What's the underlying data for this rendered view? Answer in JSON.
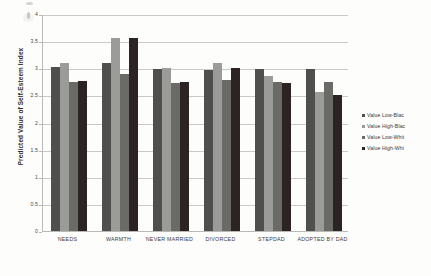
{
  "chart_data": {
    "type": "bar",
    "title": "",
    "xlabel": "",
    "ylabel": "Predicted Value of Self-Esteem Index",
    "ylim": [
      0,
      4
    ],
    "ytick_labels": [
      "4",
      "3.5",
      "3",
      "2.5",
      "2",
      "1.5",
      "1",
      "0.5",
      "0"
    ],
    "ytick_values": [
      4,
      3.5,
      3,
      2.5,
      2,
      1.5,
      1,
      0.5,
      0
    ],
    "grid": true,
    "legend_position": "right",
    "categories": [
      "NEEDS",
      "WARMTH",
      "NEVER MARRIED",
      "DIVORCED",
      "STEPDAD",
      "ADOPTED BY DAD"
    ],
    "series": [
      {
        "name": "Value Low-Blac",
        "color": "#4f4f4d",
        "values": [
          3.02,
          3.09,
          2.98,
          2.97,
          2.98,
          2.98
        ]
      },
      {
        "name": "Value High-Blac",
        "color": "#9b9b97",
        "values": [
          3.1,
          3.55,
          3.0,
          3.1,
          2.86,
          2.56
        ]
      },
      {
        "name": "Value Low-Whit",
        "color": "#6a6a67",
        "values": [
          2.75,
          2.89,
          2.73,
          2.78,
          2.75,
          2.75
        ]
      },
      {
        "name": "Value High-Whi",
        "color": "#2c2422",
        "values": [
          2.76,
          3.55,
          2.74,
          3.0,
          2.72,
          2.5
        ]
      }
    ]
  },
  "legend": {
    "items": [
      {
        "label": "Value Low-Blac"
      },
      {
        "label": "Value High-Blac"
      },
      {
        "label": "Value Low-Whit"
      },
      {
        "label": "Value High-Whi"
      }
    ]
  }
}
